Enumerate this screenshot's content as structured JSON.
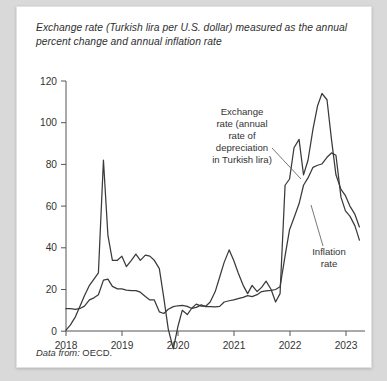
{
  "card": {
    "title": "Exchange rate (Turkish lira per U.S. dollar) measured as the annual percent change and annual inflation rate",
    "source_label": "Data from:",
    "source_value": " OECD."
  },
  "chart_data": {
    "type": "line",
    "title": "Exchange rate (Turkish lira per U.S. dollar) measured as the annual percent change and annual inflation rate",
    "xlabel": "",
    "ylabel": "",
    "xlim": [
      2018.0,
      2023.35
    ],
    "ylim": [
      -10,
      128
    ],
    "yticks": [
      0,
      20,
      40,
      60,
      80,
      100,
      120
    ],
    "xticks": [
      2018,
      2019,
      2020,
      2021,
      2022,
      2023
    ],
    "xtick_labels": [
      "2018",
      "2019",
      "2020",
      "2021",
      "2022",
      "2023"
    ],
    "ytick_labels": [
      "0",
      "20",
      "40",
      "60",
      "80",
      "100",
      "120"
    ],
    "grid": false,
    "legend": "annotations",
    "line_color": "#3a3a3a",
    "annotations": [
      {
        "name": "exchange-rate-annotation",
        "text": "Exchange rate (annual rate of depreciation in Turkish lira)",
        "lines": [
          "Exchange",
          "rate (annual",
          "rate of",
          "depreciation",
          "in Turkish lira)"
        ]
      },
      {
        "name": "inflation-rate-annotation",
        "text": "Inflation rate",
        "lines": [
          "Inflation",
          "rate"
        ]
      }
    ],
    "series": [
      {
        "name": "Exchange rate (annual rate of depreciation in Turkish lira)",
        "x": [
          2018.0,
          2018.08,
          2018.17,
          2018.25,
          2018.33,
          2018.42,
          2018.5,
          2018.58,
          2018.67,
          2018.75,
          2018.83,
          2018.92,
          2019.0,
          2019.08,
          2019.17,
          2019.25,
          2019.33,
          2019.42,
          2019.5,
          2019.58,
          2019.67,
          2019.75,
          2019.83,
          2019.92,
          2020.0,
          2020.08,
          2020.17,
          2020.25,
          2020.33,
          2020.42,
          2020.5,
          2020.58,
          2020.67,
          2020.75,
          2020.83,
          2020.92,
          2021.0,
          2021.08,
          2021.17,
          2021.25,
          2021.33,
          2021.42,
          2021.5,
          2021.58,
          2021.67,
          2021.75,
          2021.83,
          2021.92,
          2022.0,
          2022.08,
          2022.17,
          2022.25,
          2022.33,
          2022.42,
          2022.5,
          2022.58,
          2022.67,
          2022.75,
          2022.83,
          2022.92,
          2023.0,
          2023.08,
          2023.17,
          2023.25
        ],
        "values": [
          0.5,
          3.0,
          7.0,
          12.0,
          17.0,
          22.0,
          25.0,
          28.0,
          82.0,
          46.0,
          34.0,
          34.0,
          36.0,
          31.0,
          34.0,
          37.0,
          34.0,
          36.5,
          36.0,
          34.0,
          30.0,
          16.0,
          1.0,
          -8.5,
          2.0,
          10.0,
          8.0,
          11.0,
          13.0,
          12.0,
          12.0,
          14.0,
          19.0,
          26.0,
          33.0,
          39.0,
          34.0,
          28.0,
          22.0,
          18.0,
          22.0,
          19.0,
          21.0,
          24.0,
          20.0,
          14.0,
          18.0,
          70.0,
          73.0,
          88.0,
          92.0,
          75.0,
          82.0,
          97.0,
          108.0,
          114.0,
          111.0,
          92.0,
          75.0,
          68.0,
          65.0,
          60.0,
          56.0,
          50.0
        ]
      },
      {
        "name": "Inflation rate",
        "x": [
          2018.0,
          2018.08,
          2018.17,
          2018.25,
          2018.33,
          2018.42,
          2018.5,
          2018.58,
          2018.67,
          2018.75,
          2018.83,
          2018.92,
          2019.0,
          2019.08,
          2019.17,
          2019.25,
          2019.33,
          2019.42,
          2019.5,
          2019.58,
          2019.67,
          2019.75,
          2019.83,
          2019.92,
          2020.0,
          2020.08,
          2020.17,
          2020.25,
          2020.33,
          2020.42,
          2020.5,
          2020.58,
          2020.67,
          2020.75,
          2020.83,
          2020.92,
          2021.0,
          2021.08,
          2021.17,
          2021.25,
          2021.33,
          2021.42,
          2021.5,
          2021.58,
          2021.67,
          2021.75,
          2021.83,
          2021.92,
          2022.0,
          2022.08,
          2022.17,
          2022.25,
          2022.33,
          2022.42,
          2022.5,
          2022.58,
          2022.67,
          2022.75,
          2022.83,
          2022.92,
          2023.0,
          2023.08,
          2023.17,
          2023.25
        ],
        "values": [
          10.8,
          10.8,
          10.5,
          10.9,
          12.0,
          15.0,
          16.0,
          17.5,
          24.5,
          25.0,
          21.5,
          20.3,
          20.3,
          19.7,
          19.5,
          19.5,
          18.7,
          16.6,
          15.0,
          15.0,
          9.3,
          8.5,
          10.5,
          11.8,
          12.2,
          12.4,
          11.9,
          10.9,
          11.4,
          12.6,
          11.8,
          11.8,
          11.7,
          11.9,
          14.0,
          14.6,
          15.0,
          15.6,
          16.2,
          17.1,
          16.6,
          17.5,
          19.0,
          19.3,
          19.6,
          20.0,
          21.3,
          36.1,
          48.7,
          54.4,
          61.1,
          70.0,
          73.5,
          78.6,
          79.6,
          80.2,
          83.4,
          85.5,
          84.4,
          64.3,
          57.7,
          55.2,
          50.5,
          43.7
        ]
      }
    ]
  },
  "axis": {
    "y_ticks": [
      "0",
      "20",
      "40",
      "60",
      "80",
      "100",
      "120"
    ],
    "x_ticks": [
      "2018",
      "2019",
      "2020",
      "2021",
      "2022",
      "2023"
    ]
  },
  "annotations": {
    "exchange": {
      "line1": "Exchange",
      "line2": "rate (annual",
      "line3": "rate of",
      "line4": "depreciation",
      "line5": "in Turkish lira)"
    },
    "inflation": {
      "line1": "Inflation",
      "line2": "rate"
    }
  }
}
